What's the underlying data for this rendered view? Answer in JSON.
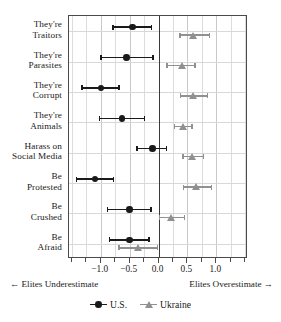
{
  "chart_data": {
    "type": "scatter",
    "subtype": "dot-and-whisker coefficient plot",
    "title": "",
    "xlabel": "",
    "ylabel": "",
    "xlim": [
      -1.55,
      1.55
    ],
    "xticks": [
      -1.0,
      -0.5,
      0.0,
      0.5,
      1.0
    ],
    "xticklabels": [
      "−1.0",
      "−0.5",
      "0.0",
      "0.5",
      "1.0"
    ],
    "minor_xticks": [
      -1.5,
      -1.25,
      -0.75,
      -0.25,
      0.25,
      0.75,
      1.25,
      1.5
    ],
    "grid": true,
    "zero_reference_line": 0.0,
    "categories": [
      "They're Traitors",
      "They're Parasites",
      "They're Corrupt",
      "They're Animals",
      "Harass on Social Media",
      "Be Protested",
      "Be Crushed",
      "Be Afraid"
    ],
    "category_lines": [
      [
        "They're",
        "Traitors"
      ],
      [
        "They're",
        "Parasites"
      ],
      [
        "They're",
        "Corrupt"
      ],
      [
        "They're",
        "Animals"
      ],
      [
        "Harass on",
        "Social Media"
      ],
      [
        "Be",
        "Protested"
      ],
      [
        "Be",
        "Crushed"
      ],
      [
        "Be",
        "Afraid"
      ]
    ],
    "legend": {
      "position": "bottom-center",
      "entries": [
        {
          "name": "U.S.",
          "marker": "circle",
          "color": "#1a1a1a"
        },
        {
          "name": "Ukraine",
          "marker": "triangle",
          "color": "#909090"
        }
      ]
    },
    "annotations": {
      "left": "← Elites Underestimate",
      "right": "Elites Overestimate →"
    },
    "series": [
      {
        "name": "U.S.",
        "marker": "circle",
        "color": "#1a1a1a",
        "values": [
          -0.45,
          -0.55,
          -1.0,
          -0.63,
          -0.1,
          -1.1,
          -0.5,
          -0.5
        ],
        "ci_low": [
          -0.79,
          -1.0,
          -1.32,
          -1.02,
          -0.37,
          -1.42,
          -0.88,
          -0.85
        ],
        "ci_high": [
          -0.12,
          -0.1,
          -0.68,
          -0.24,
          0.14,
          -0.78,
          -0.13,
          -0.16
        ]
      },
      {
        "name": "Ukraine",
        "marker": "triangle",
        "color": "#909090",
        "values": [
          0.6,
          0.4,
          0.6,
          0.42,
          0.58,
          0.65,
          0.22,
          -0.35
        ],
        "ci_low": [
          0.37,
          0.15,
          0.38,
          0.28,
          0.42,
          0.43,
          0.02,
          -0.68
        ],
        "ci_high": [
          0.88,
          0.63,
          0.85,
          0.58,
          0.78,
          0.92,
          0.45,
          -0.02
        ]
      }
    ]
  },
  "colors": {
    "us": "#1a1a1a",
    "ukraine": "#909090",
    "grid": "#c9c9c9",
    "minor_grid": "#dcdcdc",
    "axis": "#4a4a4a",
    "zero_line": "#3a3a3a",
    "background": "#ffffff"
  }
}
